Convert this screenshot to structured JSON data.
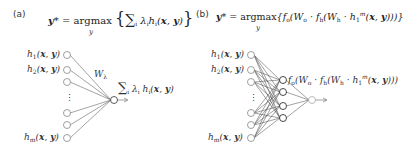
{
  "panels": [
    {
      "label": "(a)",
      "equation": "y* = argmax_y { Σ_i λ_i h_i(x, y) }",
      "weight_label": "W_λ",
      "output_label": "Σ_i λ_i h_i(x, y)",
      "inputs": [
        "h1(x, y)",
        "h2(x, y)",
        "",
        "⋮",
        "",
        "",
        "hm(x, y)"
      ]
    },
    {
      "label": "(b)",
      "equation": "y* = argmax_y { f_o( W_o · f_h( W_h · h_1^m(x, y) ) ) }",
      "hidden_label": "f_o( W_o · f_h( W_h · h_1^m(x, y) ) )",
      "inputs": [
        "h1(x, y)",
        "h2(x, y)",
        "",
        "⋮",
        "",
        "",
        "hm(x, y)"
      ]
    }
  ],
  "text": {
    "a_label": "(a)",
    "b_label": "(b)",
    "ellipsis": "⋮"
  }
}
